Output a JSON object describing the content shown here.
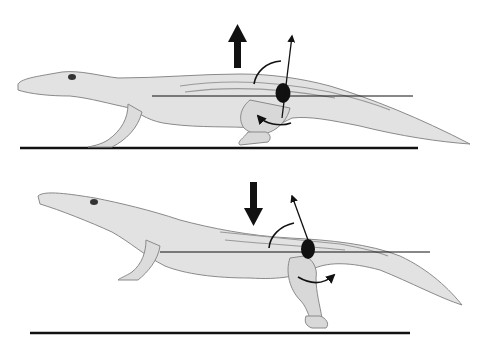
{
  "diagram": {
    "description": "Crocodile hip joint posture comparison",
    "colors": {
      "background": "#ffffff",
      "body_fill": "#e2e2e2",
      "body_shade": "#c9c9c9",
      "outline": "#8a8a8a",
      "ink": "#111111"
    },
    "panels": [
      {
        "id": "top",
        "posture": "high walk",
        "big_arrow": "up",
        "rotation_arrow": "counterclockwise",
        "ground_y": 148,
        "hip_line_y": 96
      },
      {
        "id": "bottom",
        "posture": "sprawl",
        "big_arrow": "down",
        "rotation_arrow": "clockwise",
        "ground_y": 333,
        "hip_line_y": 252
      }
    ]
  }
}
